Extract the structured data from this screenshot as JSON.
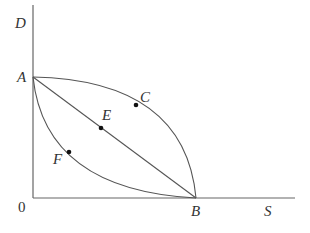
{
  "diagram": {
    "axes": {
      "y_label": "D",
      "x_label": "S",
      "origin_label": "0"
    },
    "points": {
      "A": "A",
      "B": "B",
      "C": "C",
      "E": "E",
      "F": "F"
    },
    "curves": [
      {
        "name": "concave-curve",
        "through": [
          "A",
          "C",
          "B"
        ]
      },
      {
        "name": "straight-line",
        "through": [
          "A",
          "E",
          "B"
        ]
      },
      {
        "name": "convex-curve",
        "through": [
          "A",
          "F",
          "B"
        ]
      }
    ],
    "colors": {
      "line": "#555555",
      "dot": "#111111",
      "label": "#333333"
    }
  }
}
